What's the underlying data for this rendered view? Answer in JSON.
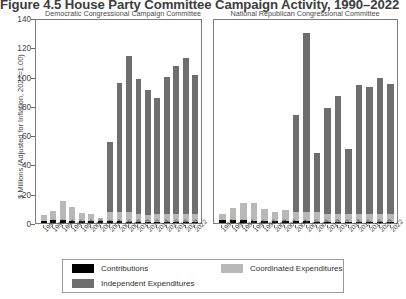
{
  "figure": {
    "title": "Figure 4.5 House Party Committee Campaign Activity, 1990–2022"
  },
  "axes": {
    "ylabel": "$ Millions (Adjusted for Inflation, 2022=1.00)",
    "yticks": [
      0,
      20,
      40,
      60,
      80,
      100,
      120,
      140
    ]
  },
  "legend": {
    "contributions": "Contributions",
    "coordinated": "Coordinated Expenditures",
    "independent": "Independent Expenditures"
  },
  "colors": {
    "contributions": "#000000",
    "coordinated": "#b8b8b8",
    "independent": "#6e6e6e",
    "axis": "#7d7d7d",
    "background": "#ffffff"
  },
  "panels": [
    {
      "id": "dem",
      "title": "Democratic Congressional Campaign Committee"
    },
    {
      "id": "rep",
      "title": "National Republican Congressional Committee"
    }
  ],
  "chart_data": {
    "type": "bar",
    "title": "Figure 4.5 House Party Committee Campaign Activity, 1990–2022",
    "xlabel": "",
    "ylabel": "$ Millions (Adjusted for Inflation, 2022=1.00)",
    "ylim": [
      0,
      140
    ],
    "yticks": [
      0,
      20,
      40,
      60,
      80,
      100,
      120,
      140
    ],
    "grid": false,
    "stacked": true,
    "legend_position": "bottom",
    "legend_entries": [
      "Contributions",
      "Coordinated Expenditures",
      "Independent Expenditures"
    ],
    "categories": [
      "1990",
      "1992",
      "1994",
      "1996",
      "1998",
      "2000",
      "2002",
      "2004",
      "2006",
      "2008",
      "2010",
      "2012",
      "2014",
      "2016",
      "2018",
      "2020",
      "2022"
    ],
    "panels": [
      {
        "name": "Democratic Congressional Campaign Committee",
        "series": [
          {
            "name": "Contributions",
            "values": [
              1.6,
              1.9,
              2.0,
              1.7,
              1.5,
              1.4,
              1.3,
              1.1,
              1.2,
              1.0,
              0.9,
              0.9,
              0.9,
              0.9,
              0.9,
              0.9,
              0.9
            ]
          },
          {
            "name": "Coordinated Expenditures",
            "values": [
              3.8,
              6.2,
              13.5,
              9.2,
              5.4,
              4.8,
              2.3,
              6.6,
              6.6,
              6.5,
              5.4,
              4.9,
              5.2,
              5.6,
              5.4,
              5.6,
              5.5
            ]
          },
          {
            "name": "Independent Expenditures",
            "values": [
              0.0,
              0.0,
              0.0,
              0.0,
              0.0,
              0.0,
              0.0,
              48.0,
              89.0,
              108.0,
              93.0,
              86.0,
              80.0,
              94.0,
              102.0,
              107.0,
              96.0
            ]
          },
          {
            "name": "Total",
            "values": [
              5.4,
              8.1,
              15.5,
              10.9,
              6.9,
              6.2,
              3.6,
              55.7,
              96.8,
              115.5,
              99.3,
              91.8,
              86.1,
              100.5,
              108.3,
              113.5,
              102.4
            ]
          }
        ]
      },
      {
        "name": "National Republican Congressional Committee",
        "series": [
          {
            "name": "Contributions",
            "values": [
              1.8,
              1.8,
              1.9,
              1.7,
              1.6,
              1.5,
              1.4,
              1.2,
              1.1,
              1.0,
              0.9,
              0.9,
              0.9,
              0.9,
              0.9,
              0.9,
              0.9
            ]
          },
          {
            "name": "Coordinated Expenditures",
            "values": [
              4.6,
              8.4,
              11.8,
              12.2,
              8.0,
              6.2,
              7.3,
              6.6,
              6.7,
              6.3,
              5.3,
              5.6,
              5.4,
              5.4,
              5.0,
              5.1,
              5.0
            ]
          },
          {
            "name": "Independent Expenditures",
            "values": [
              0.0,
              0.0,
              0.0,
              0.0,
              0.0,
              0.0,
              0.0,
              67.0,
              123.0,
              41.0,
              73.0,
              81.0,
              45.0,
              89.0,
              88.0,
              94.0,
              90.0
            ]
          },
          {
            "name": "Total",
            "values": [
              6.4,
              10.2,
              13.7,
              13.9,
              9.6,
              7.7,
              8.7,
              74.8,
              130.8,
              48.3,
              79.2,
              87.5,
              51.3,
              95.3,
              93.9,
              100.0,
              95.9
            ]
          }
        ]
      }
    ]
  }
}
